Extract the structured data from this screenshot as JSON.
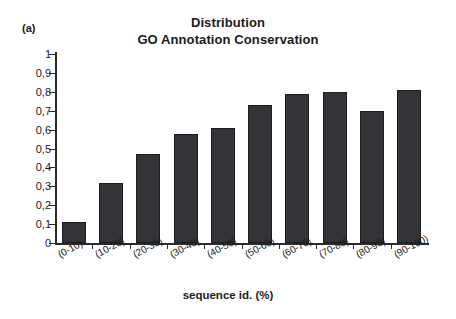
{
  "panel_label": "(a)",
  "title": {
    "line1": "Distribution",
    "line2": "GO Annotation Conservation"
  },
  "x_axis_title": "sequence id. (%)",
  "colors": {
    "bar": "#333338",
    "bar_edge": "#1c1c20",
    "axis": "#2b2b2b",
    "background": "#ffffff"
  },
  "chart_data": {
    "type": "bar",
    "title": "Distribution GO Annotation Conservation",
    "xlabel": "sequence id. (%)",
    "ylabel": "",
    "ylim": [
      0,
      1
    ],
    "grid": false,
    "legend": null,
    "categories": [
      "(0-10)",
      "(10-20)",
      "(20-30)",
      "(30-40)",
      "(40-50)",
      "(50-60)",
      "(60-70)",
      "(70-80)",
      "(80-90)",
      "(90-100)"
    ],
    "values": [
      0.11,
      0.32,
      0.47,
      0.575,
      0.61,
      0.73,
      0.79,
      0.8,
      0.7,
      0.81
    ],
    "ytick_values": [
      0,
      0.1,
      0.2,
      0.3,
      0.4,
      0.5,
      0.6,
      0.7,
      0.8,
      0.9,
      1
    ],
    "ytick_labels": [
      "0",
      "0,1",
      "0,2",
      "0,3",
      "0,4",
      "0,5",
      "0,6",
      "0,7",
      "0,8",
      "0,9",
      "1"
    ]
  }
}
